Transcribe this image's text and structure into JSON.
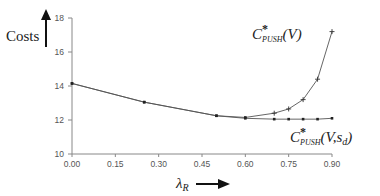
{
  "chart_data": {
    "type": "line",
    "title": "",
    "ylabel": "Costs",
    "xlabel": "λ_R",
    "xlabel_main": "λ",
    "xlabel_sub": "R",
    "xlim": [
      0,
      0.9
    ],
    "ylim": [
      10,
      18
    ],
    "x_ticks": [
      "0.00",
      "0.15",
      "0.30",
      "0.45",
      "0.60",
      "0.75",
      "0.90"
    ],
    "x_tick_values": [
      0,
      0.15,
      0.3,
      0.45,
      0.6,
      0.75,
      0.9
    ],
    "y_ticks": [
      "10",
      "12",
      "14",
      "16",
      "18"
    ],
    "y_tick_values": [
      10,
      12,
      14,
      16,
      18
    ],
    "grid": false,
    "legend": "inline annotations",
    "series": [
      {
        "name": "C*PUSH(V)",
        "label_main": "C",
        "label_star": "*",
        "label_sub": "PUSH",
        "label_args": "(V)",
        "marker": "plus",
        "x": [
          0.0,
          0.25,
          0.5,
          0.6,
          0.7,
          0.75,
          0.8,
          0.85,
          0.9
        ],
        "values": [
          14.15,
          13.05,
          12.25,
          12.15,
          12.4,
          12.65,
          13.2,
          14.4,
          17.2
        ]
      },
      {
        "name": "C*PUSH(V,sd)",
        "label_main": "C",
        "label_star": "*",
        "label_sub": "PUSH",
        "label_args_pre": "(V,s",
        "label_args_sub": "d",
        "label_args_post": ")",
        "marker": "dot",
        "x": [
          0.0,
          0.25,
          0.5,
          0.6,
          0.7,
          0.75,
          0.8,
          0.85,
          0.9
        ],
        "values": [
          14.15,
          13.05,
          12.25,
          12.1,
          12.05,
          12.05,
          12.05,
          12.05,
          12.1
        ]
      }
    ]
  }
}
